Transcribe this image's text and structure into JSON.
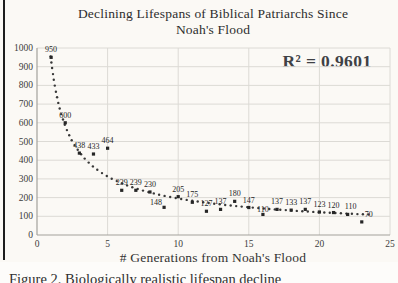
{
  "page": {
    "caption": "Figure 2. Biologically realistic lifespan decline"
  },
  "chart_data": {
    "type": "scatter",
    "title_line1": "Declining Lifespans of Biblical Patriarchs Since",
    "title_line2": "Noah's Flood",
    "xlabel": "# Generations from Noah's Flood",
    "ylabel": "",
    "annotation": "R² = 0.9601",
    "xlim": [
      0,
      25
    ],
    "ylim": [
      0,
      1000
    ],
    "x_ticks": [
      0,
      5,
      10,
      15,
      20,
      25
    ],
    "y_ticks": [
      0,
      100,
      200,
      300,
      400,
      500,
      600,
      700,
      800,
      900,
      1000
    ],
    "grid": true,
    "points": [
      {
        "x": 1,
        "y": 950,
        "label": "950"
      },
      {
        "x": 2,
        "y": 600,
        "label": "600"
      },
      {
        "x": 3,
        "y": 438,
        "label": "438"
      },
      {
        "x": 4,
        "y": 433,
        "label": "433"
      },
      {
        "x": 5,
        "y": 464,
        "label": "464"
      },
      {
        "x": 6,
        "y": 239,
        "label": "239"
      },
      {
        "x": 7,
        "y": 239,
        "label": "239"
      },
      {
        "x": 8,
        "y": 230,
        "label": "230"
      },
      {
        "x": 9,
        "y": 148,
        "label": "148",
        "dx": -8,
        "dy": 3
      },
      {
        "x": 10,
        "y": 205,
        "label": "205"
      },
      {
        "x": 11,
        "y": 175,
        "label": "175"
      },
      {
        "x": 12,
        "y": 127,
        "label": "127"
      },
      {
        "x": 13,
        "y": 137,
        "label": "137"
      },
      {
        "x": 14,
        "y": 180,
        "label": "180"
      },
      {
        "x": 15,
        "y": 147,
        "label": "147"
      },
      {
        "x": 16,
        "y": 110,
        "label": "110",
        "dy": 3
      },
      {
        "x": 17,
        "y": 137,
        "label": "137"
      },
      {
        "x": 18,
        "y": 133,
        "label": "133"
      },
      {
        "x": 19,
        "y": 137,
        "label": "137"
      },
      {
        "x": 20,
        "y": 123,
        "label": "123"
      },
      {
        "x": 21,
        "y": 120,
        "label": "120"
      },
      {
        "x": 22,
        "y": 110,
        "label": "110",
        "dx": 3
      },
      {
        "x": 23,
        "y": 70,
        "label": "70",
        "dx": 7
      }
    ],
    "trendline": {
      "type": "power",
      "a": 935,
      "b": -0.68,
      "x_start": 0.97,
      "x_end": 23.6,
      "dot_spacing_px": 5.5
    },
    "colors": {
      "point": "#262626",
      "trend": "#383838",
      "grid": "#dcdad5",
      "axis": "#a3a19c",
      "tick_text": "#3b3b3b",
      "label_text": "#262626",
      "r2_text": "#3f4145"
    }
  }
}
